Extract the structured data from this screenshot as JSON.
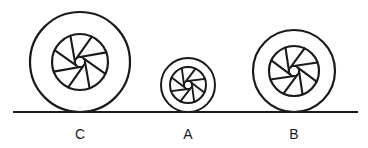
{
  "diagram": {
    "ground": {
      "x1": 13,
      "x2": 358,
      "y": 112
    },
    "ink_color": "#1a1a1a",
    "wheels": [
      {
        "label": "C",
        "cx": 80,
        "cy": 62,
        "r_outer": 50,
        "r_inner": 28,
        "r_hub": 5,
        "spokes": 8
      },
      {
        "label": "A",
        "cx": 188,
        "cy": 85,
        "r_outer": 27,
        "r_inner": 18,
        "r_hub": 4,
        "spokes": 8
      },
      {
        "label": "B",
        "cx": 294,
        "cy": 71,
        "r_outer": 41,
        "r_inner": 25,
        "r_hub": 5,
        "spokes": 8
      }
    ]
  },
  "labels": {
    "c": "C",
    "a": "A",
    "b": "B"
  }
}
